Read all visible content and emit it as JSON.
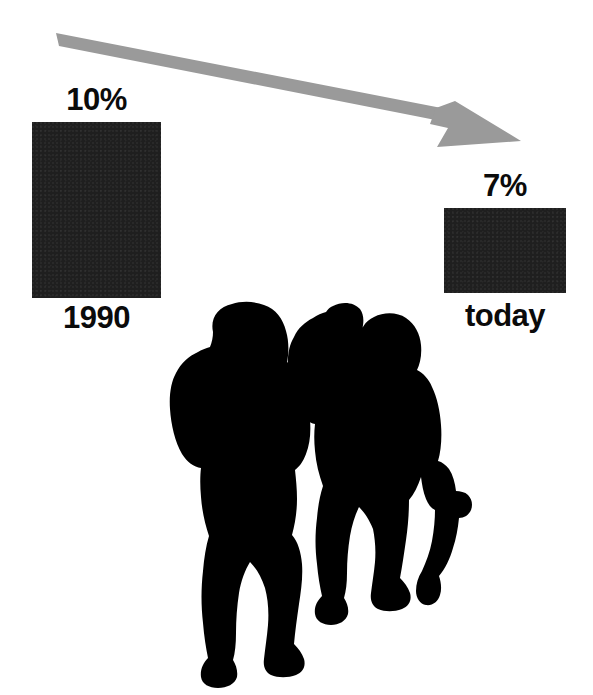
{
  "figure": {
    "background_color": "#ffffff"
  },
  "arrow": {
    "name": "downward-trend-arrow",
    "color": "#9a9a9a",
    "direction": "left-to-right descending",
    "start": [
      56,
      34
    ],
    "tip": [
      521,
      142
    ]
  },
  "bars": [
    {
      "key": "1990",
      "value_label": "10%",
      "category_label": "1990",
      "value": 10,
      "color": "#1f1f1f",
      "x": 32,
      "y": 122,
      "width": 129,
      "height": 176
    },
    {
      "key": "today",
      "value_label": "7%",
      "category_label": "today",
      "value": 7,
      "color": "#1f1f1f",
      "x": 444,
      "y": 208,
      "width": 122,
      "height": 85
    }
  ],
  "silhouettes": [
    {
      "name": "child-silhouette-large",
      "description": "standing child, arms at sides, wearing shorts",
      "color": "#000000"
    },
    {
      "name": "child-silhouette-small",
      "description": "smaller child holding a doll in right hand",
      "color": "#000000"
    }
  ],
  "chart_data": {
    "type": "bar",
    "categories": [
      "1990",
      "today"
    ],
    "values": [
      10,
      7
    ],
    "value_labels": [
      "10%",
      "7%"
    ],
    "title": "",
    "xlabel": "",
    "ylabel": "",
    "ylim": [
      0,
      10
    ],
    "grid": false,
    "legend": "none",
    "annotations": [
      {
        "text": "10%",
        "category": "1990",
        "position": "above-bar"
      },
      {
        "text": "7%",
        "category": "today",
        "position": "above-bar"
      },
      {
        "text": "1990",
        "category": "1990",
        "position": "below-bar"
      },
      {
        "text": "today",
        "category": "today",
        "position": "below-bar"
      }
    ],
    "series_colors": [
      "#1f1f1f"
    ]
  }
}
